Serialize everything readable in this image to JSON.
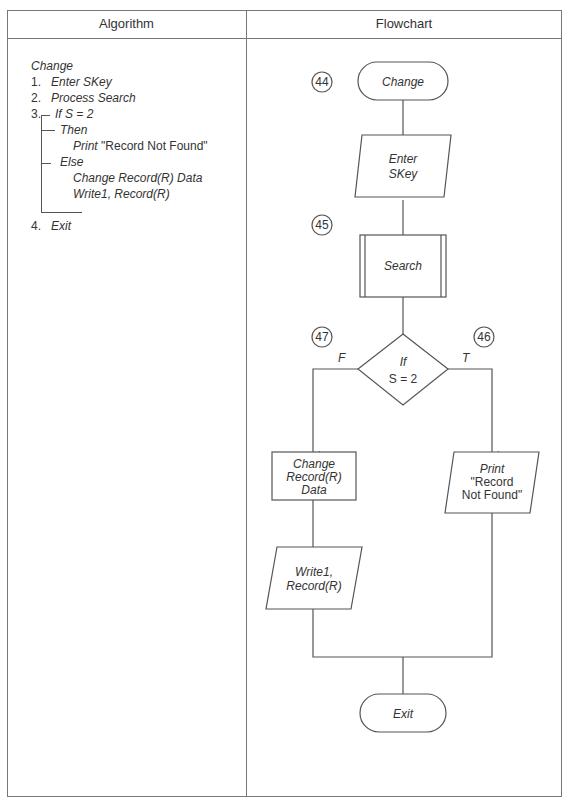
{
  "headers": {
    "algorithm": "Algorithm",
    "flowchart": "Flowchart"
  },
  "algorithm": {
    "title": "Change",
    "steps": [
      {
        "num": "1.",
        "text": "Enter SKey"
      },
      {
        "num": "2.",
        "text": "Process Search"
      },
      {
        "num": "3.",
        "text": "If S = 2"
      },
      {
        "num": "4.",
        "text": "Exit"
      }
    ],
    "then_label": "Then",
    "then_action_verb": "Print",
    "then_action_value": "\"Record Not Found\"",
    "else_label": "Else",
    "else_actions": [
      "Change Record(R) Data",
      "Write1, Record(R)"
    ]
  },
  "flowchart": {
    "connectors": {
      "start": "44",
      "search": "45",
      "true_branch": "46",
      "false_branch": "47"
    },
    "start": "Change",
    "input": [
      "Enter",
      "SKey"
    ],
    "process": "Search",
    "decision": [
      "If",
      "S = 2"
    ],
    "false_label": "F",
    "true_label": "T",
    "false_process": [
      "Change",
      "Record(R)",
      "Data"
    ],
    "false_output": [
      "Write1,",
      "Record(R)"
    ],
    "true_output": [
      "Print",
      "\"Record",
      "Not Found\""
    ],
    "end": "Exit"
  }
}
